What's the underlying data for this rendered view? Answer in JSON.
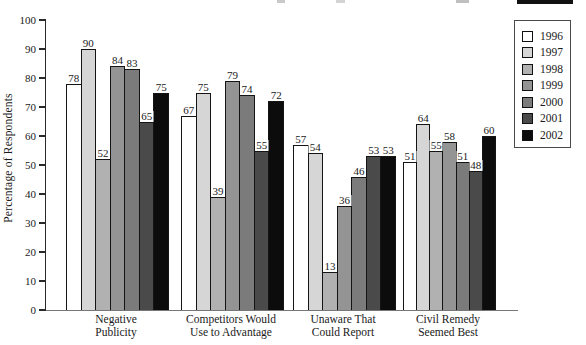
{
  "artifacts": [
    {
      "name": "cropped-text-fragment-left",
      "x": 277,
      "y": 0,
      "w": 8,
      "h": 3,
      "color": "#c9c9c9"
    },
    {
      "name": "cropped-text-fragment-middle",
      "x": 336,
      "y": 0,
      "w": 9,
      "h": 3,
      "color": "#d4d4d4"
    },
    {
      "name": "cropped-text-fragment-right",
      "x": 456,
      "y": 0,
      "w": 13,
      "h": 3,
      "color": "#c0c0c0"
    },
    {
      "name": "cropped-black-bar",
      "x": 517,
      "y": 0,
      "w": 56,
      "h": 4,
      "color": "#111111"
    }
  ],
  "chart_data": {
    "type": "bar",
    "title": "",
    "xlabel": "",
    "ylabel": "Percentage of Respondents",
    "ylim": [
      0,
      100
    ],
    "yticks": [
      0,
      10,
      20,
      30,
      40,
      50,
      60,
      70,
      80,
      90,
      100
    ],
    "grid": false,
    "bar_value_labels": true,
    "legend_position": "upper-right",
    "categories": [
      "Negative\nPublicity",
      "Competitors Would\nUse to Advantage",
      "Unaware That\nCould Report",
      "Civil Remedy\nSeemed Best"
    ],
    "series": [
      {
        "name": "1996",
        "color": "#ffffff",
        "values": [
          78,
          67,
          57,
          51
        ]
      },
      {
        "name": "1997",
        "color": "#d6d6d6",
        "values": [
          90,
          75,
          54,
          64
        ]
      },
      {
        "name": "1998",
        "color": "#b1b1b1",
        "values": [
          52,
          39,
          13,
          55
        ]
      },
      {
        "name": "1999",
        "color": "#949494",
        "values": [
          84,
          79,
          36,
          58
        ]
      },
      {
        "name": "2000",
        "color": "#7b7b7b",
        "values": [
          83,
          74,
          46,
          51
        ]
      },
      {
        "name": "2001",
        "color": "#4a4a4a",
        "values": [
          65,
          55,
          53,
          48
        ]
      },
      {
        "name": "2002",
        "color": "#0c0c0c",
        "values": [
          75,
          72,
          53,
          60
        ]
      }
    ]
  }
}
